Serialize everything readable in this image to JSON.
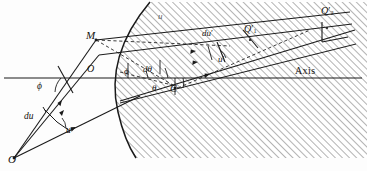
{
  "figure": {
    "type": "geometric-optics-ray-diagram",
    "width": 367,
    "height": 171,
    "background_color": "#fdfdfd",
    "ink_color": "#15120f",
    "hatch_color": "#8d8d8d"
  },
  "labels": {
    "object_point": "O",
    "vertex_point": "O",
    "marginal_point": "M",
    "center_point": "C",
    "image_point_1": "Q",
    "image_point_1_sub": "1",
    "image_point_2": "Q",
    "image_point_2_sub": "2",
    "axis": "Axis",
    "angle_phi_left": "ϕ",
    "angle_phi_center": "ϕ",
    "angle_dtheta": "dθ",
    "angle_theta": "θ",
    "angle_theta_right": "θ",
    "object_angle_u": "u",
    "object_angle_du": "du",
    "image_angle_u_prime": "u",
    "image_angle_du_prime": "du",
    "medium_index_u": "u",
    "prime_mark": "′"
  },
  "geometry": {
    "axis_y": 78,
    "axis_x_start": 4,
    "axis_x_end": 362,
    "object_point_xy": [
      14,
      158
    ],
    "vertex_xy": [
      97,
      78
    ],
    "marginal_point_xy": [
      96,
      40
    ],
    "center_point_xy": [
      175,
      88
    ],
    "image_q1_xy": [
      250,
      35
    ],
    "image_q2_xy": [
      327,
      18
    ],
    "surface_top_xy": [
      150,
      2
    ],
    "surface_bottom_xy": [
      133,
      158
    ],
    "hatch_bottom_y": 158,
    "hatch_angle_deg": 45
  }
}
